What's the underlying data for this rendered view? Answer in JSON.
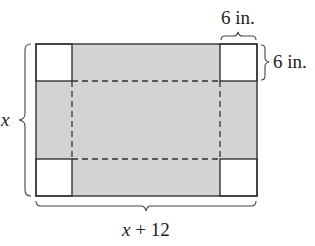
{
  "diagram": {
    "labels": {
      "top_corner_width": "6 in.",
      "right_corner_height": "6 in.",
      "left_side": "x",
      "bottom_side_var": "x",
      "bottom_side_rest": " + 12"
    },
    "colors": {
      "shaded": "#d3d3d3",
      "corner": "#ffffff",
      "stroke": "#333333"
    }
  }
}
